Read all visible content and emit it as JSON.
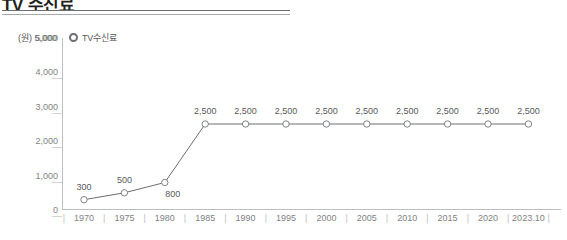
{
  "title": "TV 수신료",
  "legend": {
    "marker_name": "legend-circle-marker",
    "label": "TV수신료"
  },
  "axis": {
    "y_unit": "(원) 5,000",
    "y_ticks": [
      "5,000",
      "4,000",
      "3,000",
      "2,000",
      "1,000",
      "0"
    ],
    "x_separator": "|"
  },
  "colors": {
    "line": "#6d6e71",
    "marker_stroke": "#808285",
    "marker_fill": "#ffffff",
    "axis": "#bcbec0",
    "text": "#58585a",
    "tick_text": "#808285",
    "title": "#231f20"
  },
  "chart_data": {
    "type": "line",
    "title": "TV 수신료",
    "xlabel": "",
    "ylabel": "(원)",
    "ylim": [
      0,
      5000
    ],
    "yticks": [
      0,
      1000,
      2000,
      3000,
      4000,
      5000
    ],
    "grid": false,
    "legend_position": "top-left",
    "series": [
      {
        "name": "TV수신료",
        "values": [
          300,
          500,
          800,
          2500,
          2500,
          2500,
          2500,
          2500,
          2500,
          2500,
          2500,
          2500
        ]
      }
    ],
    "categories": [
      "1970",
      "1975",
      "1980",
      "1985",
      "1990",
      "1995",
      "2000",
      "2005",
      "2010",
      "2015",
      "2020",
      "2023.10"
    ],
    "point_labels": [
      "300",
      "500",
      "800",
      "2,500",
      "2,500",
      "2,500",
      "2,500",
      "2,500",
      "2,500",
      "2,500",
      "2,500",
      "2,500"
    ],
    "label_positions": [
      "above",
      "above",
      "below",
      "above",
      "above",
      "above",
      "above",
      "above",
      "above",
      "above",
      "above",
      "above"
    ]
  }
}
